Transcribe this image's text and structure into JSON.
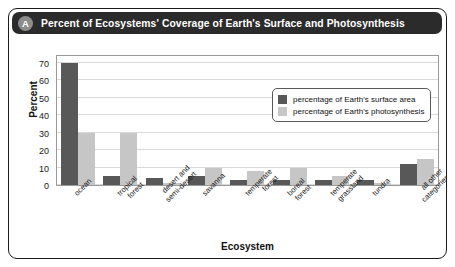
{
  "header": {
    "badge": "A",
    "title": "Percent of Ecosystems' Coverage of Earth's Surface and Photosynthesis"
  },
  "chart_data": {
    "type": "bar",
    "title": "Percent of Ecosystems' Coverage of Earth's Surface and Photosynthesis",
    "xlabel": "Ecosystem",
    "ylabel": "Percent",
    "ylim": [
      0,
      75
    ],
    "yticks": [
      0,
      10,
      20,
      30,
      40,
      50,
      60,
      70
    ],
    "grid": true,
    "legend_position": "inside-top-right",
    "categories": [
      "ocean",
      "tropical\nforest",
      "desert and\nsemi-desert",
      "savanna",
      "temperate\nforest",
      "boreal\nforest",
      "temperate\ngrassland",
      "tundra",
      "all other\ncategories"
    ],
    "series": [
      {
        "name": "percentage of Earth's surface area",
        "color": "#585858",
        "values": [
          70,
          5,
          4,
          5,
          3,
          3,
          3,
          3,
          12
        ]
      },
      {
        "name": "percentage of Earth's photosynthesis",
        "color": "#c6c6c6",
        "values": [
          30,
          30,
          1,
          10,
          8,
          10,
          5,
          1,
          15
        ]
      }
    ]
  },
  "colors": {
    "header_bg": "#2b2b2b",
    "badge_bg": "#8d8d8d",
    "border": "#1c1c1c",
    "dark_bar": "#585858",
    "light_bar": "#c6c6c6",
    "gridline": "#d9d9d9"
  }
}
